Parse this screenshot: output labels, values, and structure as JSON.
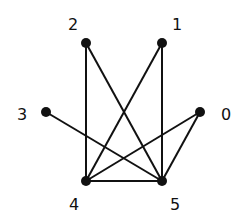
{
  "diagram": {
    "type": "graph",
    "nodes": [
      {
        "id": "0",
        "label": "0",
        "x": 200,
        "y": 112,
        "lx": 226,
        "ly": 120
      },
      {
        "id": "1",
        "label": "1",
        "x": 162,
        "y": 43,
        "lx": 177,
        "ly": 30
      },
      {
        "id": "2",
        "label": "2",
        "x": 86,
        "y": 43,
        "lx": 73,
        "ly": 30
      },
      {
        "id": "3",
        "label": "3",
        "x": 46,
        "y": 112,
        "lx": 22,
        "ly": 120
      },
      {
        "id": "4",
        "label": "4",
        "x": 86,
        "y": 181,
        "lx": 74,
        "ly": 210
      },
      {
        "id": "5",
        "label": "5",
        "x": 162,
        "y": 181,
        "lx": 175,
        "ly": 210
      }
    ],
    "edges": [
      [
        "2",
        "4"
      ],
      [
        "2",
        "5"
      ],
      [
        "1",
        "4"
      ],
      [
        "1",
        "5"
      ],
      [
        "3",
        "5"
      ],
      [
        "0",
        "4"
      ],
      [
        "0",
        "5"
      ],
      [
        "4",
        "5"
      ]
    ],
    "colors": {
      "stroke": "#111111",
      "background": "#ffffff"
    }
  }
}
